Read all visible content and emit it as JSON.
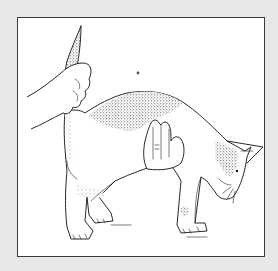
{
  "figure": {
    "description": "Line illustration of a cat being restrained: one hand holds the tail raised, the other hand supports the cat under the abdomen",
    "colors": {
      "background": "#e8e8e8",
      "frame_fill": "#ffffff",
      "frame_border": "#3a3a3a",
      "ink": "#111111"
    },
    "elements": [
      {
        "name": "hand-holding-tail"
      },
      {
        "name": "cat-tail"
      },
      {
        "name": "cat-body"
      },
      {
        "name": "hand-supporting-abdomen"
      },
      {
        "name": "cat-head"
      },
      {
        "name": "cat-legs"
      }
    ]
  }
}
